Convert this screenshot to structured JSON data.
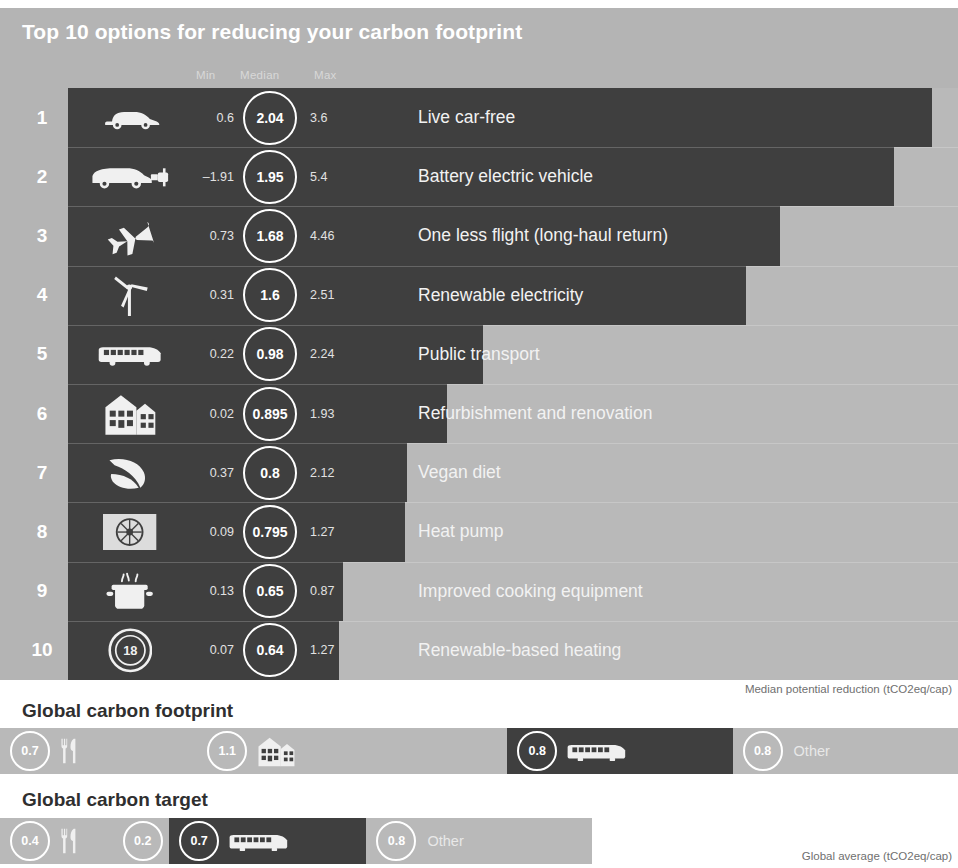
{
  "title": "Top 10 options for reducing your carbon footprint",
  "columns": {
    "min": "Min",
    "median": "Median",
    "max": "Max"
  },
  "captions": {
    "median": "Median potential reduction (tCO2eq/cap)",
    "global": "Global average (tCO2eq/cap)"
  },
  "sections": {
    "footprint_title": "Global carbon footprint",
    "target_title": "Global carbon target"
  },
  "colors": {
    "panel_bg": "#b4b4b4",
    "bar_dark": "#3f3f3f",
    "bar_light": "#b9b9b9",
    "white": "#ffffff",
    "caption": "#6f6f6f"
  },
  "chart_data": {
    "type": "bar",
    "title": "Top 10 options for reducing your carbon footprint",
    "xlabel": "Median potential reduction (tCO2eq/cap)",
    "ylabel": "",
    "xlim": [
      0,
      2.2
    ],
    "grid": false,
    "legend": "none",
    "categories": [
      "Live car-free",
      "Battery electric vehicle",
      "One less flight (long-haul return)",
      "Renewable electricity",
      "Public transport",
      "Refurbishment and renovation",
      "Vegan diet",
      "Heat pump",
      "Improved cooking equipment",
      "Renewable-based heating"
    ],
    "values": [
      2.04,
      1.95,
      1.68,
      1.6,
      0.98,
      0.895,
      0.8,
      0.795,
      0.65,
      0.64
    ],
    "series": [
      {
        "name": "Min",
        "values": [
          0.6,
          -1.91,
          0.73,
          0.31,
          0.22,
          0.02,
          0.37,
          0.09,
          0.13,
          0.07
        ]
      },
      {
        "name": "Median",
        "values": [
          2.04,
          1.95,
          1.68,
          1.6,
          0.98,
          0.895,
          0.8,
          0.795,
          0.65,
          0.64
        ]
      },
      {
        "name": "Max",
        "values": [
          3.6,
          5.4,
          4.46,
          2.51,
          2.24,
          1.93,
          2.12,
          1.27,
          0.87,
          1.27
        ]
      }
    ],
    "rows": [
      {
        "rank": "1",
        "icon": "car-icon",
        "min": "0.6",
        "median": "2.04",
        "max": "3.6",
        "label": "Live car-free"
      },
      {
        "rank": "2",
        "icon": "electric-car-icon",
        "min": "–1.91",
        "median": "1.95",
        "max": "5.4",
        "label": "Battery electric vehicle"
      },
      {
        "rank": "3",
        "icon": "airplane-icon",
        "min": "0.73",
        "median": "1.68",
        "max": "4.46",
        "label": "One less flight (long-haul return)"
      },
      {
        "rank": "4",
        "icon": "wind-turbine-icon",
        "min": "0.31",
        "median": "1.6",
        "max": "2.51",
        "label": "Renewable electricity"
      },
      {
        "rank": "5",
        "icon": "bus-icon",
        "min": "0.22",
        "median": "0.98",
        "max": "2.24",
        "label": "Public transport"
      },
      {
        "rank": "6",
        "icon": "house-icon",
        "min": "0.02",
        "median": "0.895",
        "max": "1.93",
        "label": "Refurbishment and renovation"
      },
      {
        "rank": "7",
        "icon": "leaf-icon",
        "min": "0.37",
        "median": "0.8",
        "max": "2.12",
        "label": "Vegan diet"
      },
      {
        "rank": "8",
        "icon": "heat-pump-icon",
        "min": "0.09",
        "median": "0.795",
        "max": "1.27",
        "label": "Heat pump"
      },
      {
        "rank": "9",
        "icon": "cooking-pot-icon",
        "min": "0.13",
        "median": "0.65",
        "max": "0.87",
        "label": "Improved cooking equipment"
      },
      {
        "rank": "10",
        "icon": "thermostat-icon",
        "min": "0.07",
        "median": "0.64",
        "max": "1.27",
        "label": "Renewable-based heating"
      }
    ],
    "stacked_bars": [
      {
        "name": "Global carbon footprint",
        "total": 3.4,
        "segments": [
          {
            "value": "0.7",
            "icon": "cutlery-icon",
            "text": "",
            "tone": "light"
          },
          {
            "value": "1.1",
            "icon": "house-icon",
            "text": "",
            "tone": "light"
          },
          {
            "value": "0.8",
            "icon": "bus-icon",
            "text": "",
            "tone": "dark"
          },
          {
            "value": "0.8",
            "icon": "",
            "text": "Other",
            "tone": "light"
          }
        ]
      },
      {
        "name": "Global carbon target",
        "total": 2.1,
        "segments": [
          {
            "value": "0.4",
            "icon": "cutlery-icon",
            "text": "",
            "tone": "light"
          },
          {
            "value": "0.2",
            "icon": "",
            "text": "",
            "tone": "light"
          },
          {
            "value": "0.7",
            "icon": "bus-icon",
            "text": "",
            "tone": "dark"
          },
          {
            "value": "0.8",
            "icon": "",
            "text": "Other",
            "tone": "light"
          }
        ]
      }
    ]
  }
}
